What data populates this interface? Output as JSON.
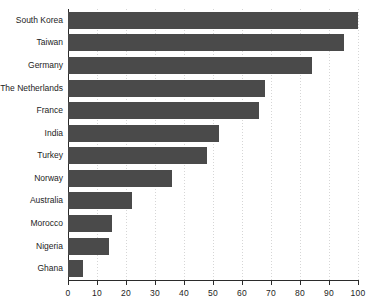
{
  "chart_data": {
    "type": "bar",
    "orientation": "horizontal",
    "title": "",
    "subtitle": "",
    "xlabel": "",
    "ylabel": "",
    "xlim": [
      0,
      100
    ],
    "xticks": [
      0,
      10,
      20,
      30,
      40,
      50,
      60,
      70,
      80,
      90,
      100
    ],
    "xtick_labels": [
      "0",
      "10",
      "20",
      "30",
      "40",
      "50",
      "60",
      "70",
      "80",
      "90",
      "100"
    ],
    "grid": true,
    "grid_axis": "x",
    "legend": false,
    "legend_position": "none",
    "bar_color": "#4a4a4a",
    "axis_color": "#2b2b2b",
    "grid_color": "#cfcfcf",
    "background_color": "#ffffff",
    "categories": [
      "South Korea",
      "Taiwan",
      "Germany",
      "The Netherlands",
      "France",
      "India",
      "Turkey",
      "Norway",
      "Australia",
      "Morocco",
      "Nigeria",
      "Ghana"
    ],
    "values": [
      100,
      95,
      84,
      68,
      66,
      52,
      48,
      36,
      22,
      15,
      14,
      5
    ]
  }
}
